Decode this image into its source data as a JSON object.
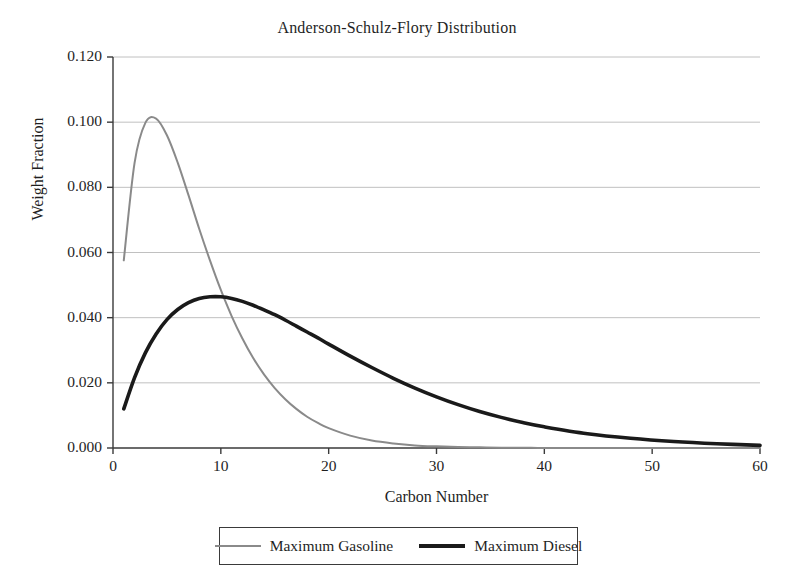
{
  "chart_data": {
    "type": "line",
    "title": "Anderson-Schulz-Flory Distribution",
    "xlabel": "Carbon Number",
    "ylabel": "Weight Fraction",
    "xlim": [
      0,
      60
    ],
    "ylim": [
      0.0,
      0.12
    ],
    "grid": "horizontal",
    "legend_position": "bottom-outside",
    "xticks": [
      0,
      10,
      20,
      30,
      40,
      50,
      60
    ],
    "xtick_labels": [
      "0",
      "10",
      "20",
      "30",
      "40",
      "50",
      "60"
    ],
    "yticks": [
      0.0,
      0.02,
      0.04,
      0.06,
      0.08,
      0.1,
      0.12
    ],
    "ytick_labels": [
      "0.000",
      "0.020",
      "0.040",
      "0.060",
      "0.080",
      "0.100",
      "0.120"
    ],
    "x": [
      1,
      2,
      3,
      4,
      5,
      6,
      7,
      8,
      9,
      10,
      11,
      12,
      13,
      14,
      15,
      16,
      17,
      18,
      19,
      20,
      22,
      24,
      26,
      28,
      30,
      32,
      34,
      36,
      38,
      40,
      44,
      48,
      52,
      56,
      60
    ],
    "series": [
      {
        "name": "Maximum Gasoline",
        "color": "#8a8a8a",
        "line_width": 2,
        "alpha_parameter": 0.76,
        "peak_x": 3.6,
        "peak_y": 0.101,
        "values": [
          0.0576,
          0.0875,
          0.0998,
          0.1011,
          0.096,
          0.0876,
          0.0776,
          0.0672,
          0.0575,
          0.0485,
          0.0405,
          0.0336,
          0.0276,
          0.0226,
          0.0184,
          0.0149,
          0.012,
          0.0096,
          0.0077,
          0.0061,
          0.0038,
          0.0023,
          0.0014,
          0.0008,
          0.0005,
          0.0003,
          0.0002,
          0.0001,
          0.0001,
          0.0,
          0.0,
          0.0,
          0.0,
          0.0,
          0.0
        ]
      },
      {
        "name": "Maximum Diesel",
        "color": "#1a1a1a",
        "line_width": 3.6,
        "alpha_parameter": 0.9,
        "peak_x": 9.0,
        "peak_y": 0.043,
        "values": [
          0.012,
          0.0216,
          0.0292,
          0.035,
          0.0394,
          0.0425,
          0.0446,
          0.0459,
          0.0464,
          0.0464,
          0.0459,
          0.045,
          0.0438,
          0.0424,
          0.0409,
          0.0392,
          0.0374,
          0.0356,
          0.0338,
          0.0319,
          0.0282,
          0.0247,
          0.0214,
          0.0184,
          0.0157,
          0.0133,
          0.0112,
          0.0094,
          0.0078,
          0.0065,
          0.0044,
          0.003,
          0.002,
          0.0013,
          0.0008
        ]
      }
    ]
  },
  "legend": {
    "entries": [
      {
        "label": "Maximum Gasoline",
        "swatch": "gasoline-line-swatch"
      },
      {
        "label": "Maximum Diesel",
        "swatch": "diesel-line-swatch"
      }
    ]
  }
}
